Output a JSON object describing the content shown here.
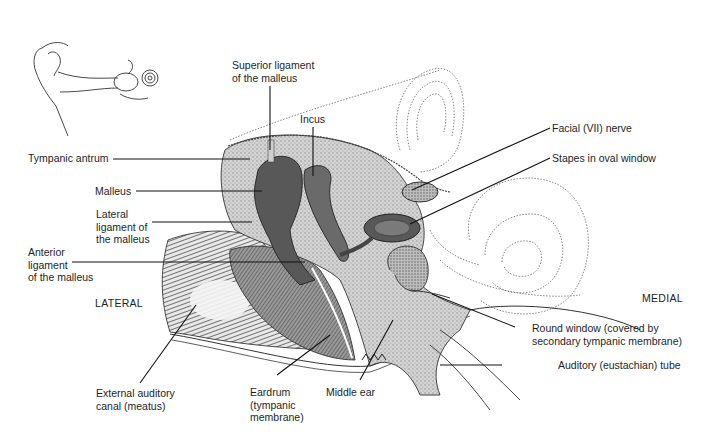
{
  "diagram": {
    "orientation": {
      "left": "LATERAL",
      "right": "MEDIAL"
    },
    "inset": {
      "icon": "ear-overview-inset-icon",
      "description": "Outer, middle and inner ear overview"
    },
    "labels": {
      "superior_ligament": "Superior ligament\nof the malleus",
      "incus": "Incus",
      "tympanic_antrum": "Tympanic antrum",
      "malleus": "Malleus",
      "lateral_ligament": "Lateral\nligament of\nthe malleus",
      "anterior_ligament": "Anterior\nligament\nof the malleus",
      "facial_nerve": "Facial (VII) nerve",
      "stapes": "Stapes in oval window",
      "round_window": "Round window (covered by\nsecondary tympanic membrane)",
      "auditory_tube": "Auditory (eustachian) tube",
      "external_canal": "External auditory\ncanal (meatus)",
      "eardrum": "Eardrum\n(tympanic\nmembrane)",
      "middle_ear": "Middle ear"
    },
    "colors": {
      "ink": "#1a1a1a",
      "ossicle_fill": "#5a5a5a",
      "bone_stipple": "#b8b8b8",
      "membrane": "#7a7a7a",
      "background": "#ffffff"
    }
  }
}
